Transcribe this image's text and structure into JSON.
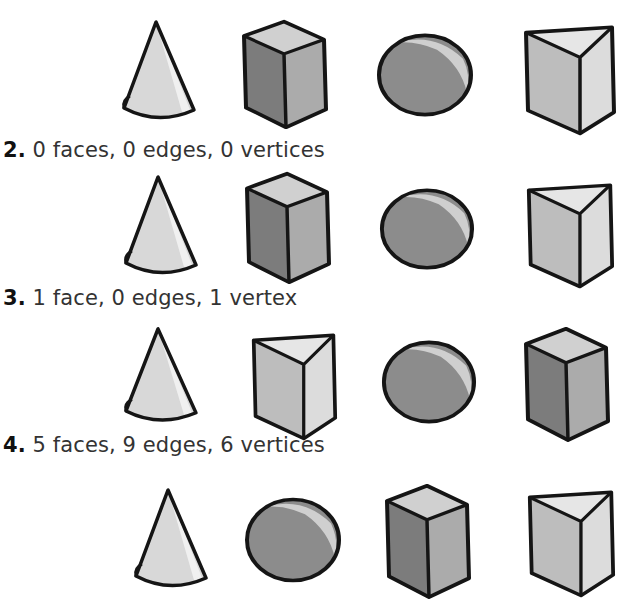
{
  "colors": {
    "outline": "#151515",
    "light": "#d6d6d6",
    "lighter": "#e4e4e4",
    "mid": "#a8a8a8",
    "dark": "#7e7e7e",
    "sphere_main": "#8c8c8c",
    "sphere_highlight": "#cfcfcf"
  },
  "options": [
    {
      "number": "1.",
      "text": "",
      "shapes": [
        "cone",
        "cuboid",
        "sphere",
        "triangular-prism"
      ]
    },
    {
      "number": "2.",
      "text": "0 faces, 0 edges, 0 vertices",
      "shapes": [
        "cone",
        "cuboid",
        "sphere",
        "triangular-prism"
      ]
    },
    {
      "number": "3.",
      "text": "1 face, 0 edges, 1 vertex",
      "shapes": [
        "cone",
        "triangular-prism",
        "sphere",
        "cuboid"
      ]
    },
    {
      "number": "4.",
      "text": "5 faces, 9 edges, 6 vertices",
      "shapes": [
        "cone",
        "sphere",
        "cuboid",
        "triangular-prism"
      ]
    }
  ]
}
